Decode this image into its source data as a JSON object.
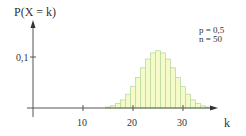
{
  "chart_data": {
    "type": "bar",
    "title": "",
    "ylabel": "P(X = k)",
    "xlabel": "k",
    "x_ticks": [
      10,
      20,
      30
    ],
    "y_ticks": [
      "0,1"
    ],
    "xlim": [
      0,
      40
    ],
    "ylim": [
      0,
      0.15
    ],
    "grid": false,
    "annotation": [
      "p = 0,5",
      "n = 50"
    ],
    "params": {
      "p": 0.5,
      "n": 50
    },
    "categories": [
      15,
      16,
      17,
      18,
      19,
      20,
      21,
      22,
      23,
      24,
      25,
      26,
      27,
      28,
      29,
      30,
      31,
      32,
      33,
      34,
      35
    ],
    "values": [
      0.002,
      0.0044,
      0.0087,
      0.016,
      0.027,
      0.0419,
      0.0598,
      0.0788,
      0.096,
      0.108,
      0.1123,
      0.108,
      0.096,
      0.0788,
      0.0598,
      0.0419,
      0.027,
      0.016,
      0.0087,
      0.0044,
      0.002
    ]
  },
  "labels": {
    "y_axis": "P(X = k)",
    "x_axis": "k",
    "y_tick": "0,1",
    "x_tick_10": "10",
    "x_tick_20": "20",
    "x_tick_30": "30",
    "param_p": "p = 0,5",
    "param_n": "n = 50"
  },
  "colors": {
    "bar_fill": "#f5fac8",
    "bar_stroke": "#b9dba0",
    "axis": "#555555"
  }
}
